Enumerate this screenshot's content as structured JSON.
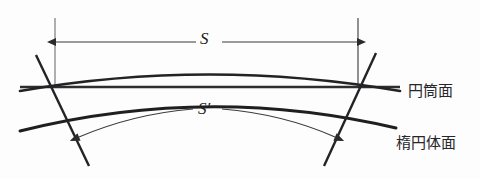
{
  "figure": {
    "kind": "geodetic-projection-diagram",
    "background_color": "#fdfdfd",
    "ink_color": "#27272a",
    "labels": {
      "cylinder_surface": "円筒面",
      "ellipsoid_surface": "楕円体面",
      "chord_distance": "S",
      "arc_distance": "S′"
    },
    "geometry": {
      "straight_line": {
        "name": "cylindrical-surface-line",
        "x1": 20,
        "y1": 87,
        "x2": 400,
        "y2": 87,
        "stroke_width": 2.6
      },
      "upper_curve": {
        "name": "cylinder-section-curve",
        "start": [
          20,
          92
        ],
        "control": [
          208,
          58
        ],
        "end": [
          400,
          92
        ],
        "stroke_width": 2.8
      },
      "lower_curve": {
        "name": "ellipsoid-surface-curve",
        "start": [
          20,
          131
        ],
        "control": [
          208,
          84
        ],
        "end": [
          396,
          128
        ],
        "stroke_width": 3.0
      },
      "left_normal": {
        "name": "left-normal-line",
        "x1": 36,
        "y1": 55,
        "x2": 89,
        "y2": 166,
        "stroke_width": 2.4
      },
      "right_normal": {
        "name": "right-normal-line",
        "x1": 376,
        "y1": 53,
        "x2": 324,
        "y2": 166,
        "stroke_width": 2.4
      },
      "left_tick": {
        "name": "left-extension-tick",
        "x1": 55,
        "y1": 18,
        "x2": 55,
        "y2": 88,
        "stroke_width": 1.1
      },
      "right_tick": {
        "name": "right-extension-tick",
        "x1": 358,
        "y1": 18,
        "x2": 358,
        "y2": 88,
        "stroke_width": 1.1
      },
      "dimension_arrow": {
        "name": "s-dimension-arrow",
        "y": 42,
        "x_left": 56,
        "x_right": 357,
        "gap_start": 196,
        "gap_end": 220,
        "stroke_width": 1.1
      },
      "arc_arrow": {
        "name": "s-prime-arc-arrow",
        "left_end": [
          79,
          137
        ],
        "right_end": [
          335,
          137
        ],
        "apex_y": 112,
        "gap_start": 193,
        "gap_end": 222,
        "stroke_width": 1.1
      }
    }
  }
}
